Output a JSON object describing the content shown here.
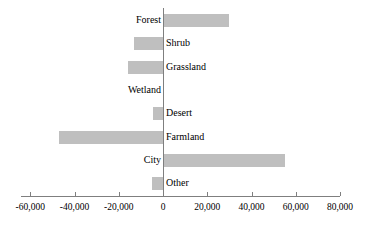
{
  "chart_data": {
    "type": "bar",
    "orientation": "horizontal",
    "title": "",
    "subtitle": "",
    "xlabel": "",
    "ylabel": "",
    "grid": false,
    "legend": false,
    "legend_position": "none",
    "bar_color": "#bfbfbf",
    "axis_color": "#7f7f7f",
    "text_color": "#000000",
    "background_color": "#ffffff",
    "xlim": [
      -60000,
      80000
    ],
    "axis_min": -64000,
    "axis_max": 80000,
    "xticks": [
      -60000,
      -40000,
      -20000,
      0,
      20000,
      40000,
      60000,
      80000
    ],
    "xticklabels": [
      "-60,000",
      "-40,000",
      "-20,000",
      "0",
      "20,000",
      "40,000",
      "60,000",
      "80,000"
    ],
    "categories": [
      "Forest",
      "Shrub",
      "Grassland",
      "Wetland",
      "Desert",
      "Farmland",
      "City",
      "Other"
    ],
    "values": [
      30000,
      -13000,
      -16000,
      0,
      -4500,
      -47000,
      55000,
      -5000
    ],
    "series": [
      {
        "name": "Area change",
        "values": [
          30000,
          -13000,
          -16000,
          0,
          -4500,
          -47000,
          55000,
          -5000
        ]
      }
    ]
  }
}
